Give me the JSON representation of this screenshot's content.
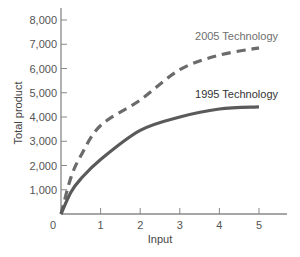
{
  "chart_data": {
    "type": "line",
    "title": "",
    "xlabel": "Input",
    "ylabel": "Total product",
    "xlim": [
      0,
      5.5
    ],
    "ylim": [
      0,
      8000
    ],
    "grid": false,
    "legend_position": "inline labels at curve ends",
    "x_ticks": [
      "0",
      "1",
      "2",
      "3",
      "4",
      "5"
    ],
    "y_ticks": [
      "1,000",
      "2,000",
      "3,000",
      "4,000",
      "5,000",
      "6,000",
      "7,000",
      "8,000"
    ],
    "x": [
      0,
      0.25,
      0.5,
      1,
      2,
      3,
      4,
      5
    ],
    "series": [
      {
        "name": "2005 Technology",
        "style": "dashed",
        "color": "#6b6b6b",
        "values": [
          0,
          1500,
          2400,
          3650,
          4700,
          5950,
          6550,
          6850
        ]
      },
      {
        "name": "1995 Technology",
        "style": "solid",
        "color": "#5a5a5a",
        "values": [
          0,
          900,
          1450,
          2250,
          3450,
          4000,
          4330,
          4420
        ]
      }
    ]
  },
  "labels": {
    "series_2005": "2005 Technology",
    "series_1995": "1995 Technology",
    "x_axis": "Input",
    "y_axis": "Total product",
    "origin": "0"
  }
}
